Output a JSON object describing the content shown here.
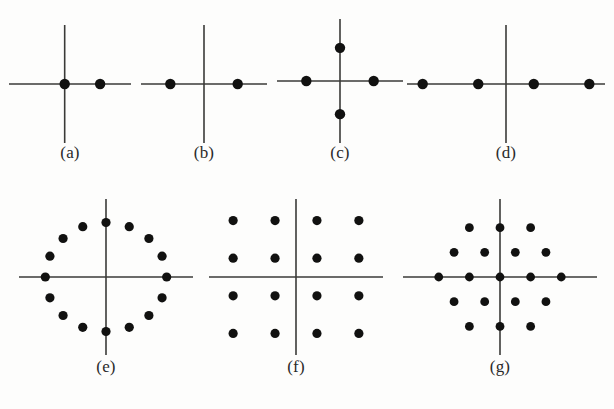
{
  "figure": {
    "background_color": "#fdfdfc",
    "axis_color": "#3a3a38",
    "dot_color": "#111110",
    "label_color": "#2a2a2a",
    "width": 614,
    "height": 409,
    "row_count": 2
  },
  "chart_data": {
    "type": "scatter",
    "subtitle": "",
    "xlabel": "",
    "ylabel": "",
    "grid": false,
    "legend": "none",
    "axis_style": "cross-through-origin",
    "panel_count": 7,
    "panels": [
      {
        "label": "(a)",
        "name": "panel-a",
        "point_count": 2,
        "xlim": [
          -1.6,
          1.9
        ],
        "ylim": [
          -1.6,
          1.6
        ],
        "points": [
          {
            "x": 0.0,
            "y": 0.0
          },
          {
            "x": 1.0,
            "y": 0.0
          }
        ]
      },
      {
        "label": "(b)",
        "name": "panel-b",
        "point_count": 2,
        "xlim": [
          -1.9,
          1.9
        ],
        "ylim": [
          -1.6,
          1.6
        ],
        "points": [
          {
            "x": -1.0,
            "y": 0.0
          },
          {
            "x": 1.0,
            "y": 0.0
          }
        ]
      },
      {
        "label": "(c)",
        "name": "panel-c",
        "point_count": 4,
        "xlim": [
          -1.9,
          1.9
        ],
        "ylim": [
          -1.9,
          1.9
        ],
        "points": [
          {
            "x": 0.0,
            "y": 1.0
          },
          {
            "x": -1.0,
            "y": 0.0
          },
          {
            "x": 1.0,
            "y": 0.0
          },
          {
            "x": 0.0,
            "y": -1.0
          }
        ]
      },
      {
        "label": "(d)",
        "name": "panel-d",
        "point_count": 4,
        "xlim": [
          -3.6,
          3.6
        ],
        "ylim": [
          -1.9,
          1.9
        ],
        "points": [
          {
            "x": -3.0,
            "y": 0.0
          },
          {
            "x": -1.0,
            "y": 0.0
          },
          {
            "x": 1.0,
            "y": 0.0
          },
          {
            "x": 3.0,
            "y": 0.0
          }
        ]
      },
      {
        "label": "(e)",
        "name": "panel-e",
        "point_count": 16,
        "xlim": [
          -1.45,
          1.45
        ],
        "ylim": [
          -1.45,
          1.45
        ],
        "ring_radius": 1.0,
        "angles_deg": [
          0,
          22.5,
          45,
          67.5,
          90,
          112.5,
          135,
          157.5,
          180,
          202.5,
          225,
          247.5,
          270,
          292.5,
          315,
          337.5
        ],
        "points": [
          {
            "x": 1.0,
            "y": 0.0
          },
          {
            "x": 0.924,
            "y": 0.383
          },
          {
            "x": 0.707,
            "y": 0.707
          },
          {
            "x": 0.383,
            "y": 0.924
          },
          {
            "x": 0.0,
            "y": 1.0
          },
          {
            "x": -0.383,
            "y": 0.924
          },
          {
            "x": -0.707,
            "y": 0.707
          },
          {
            "x": -0.924,
            "y": 0.383
          },
          {
            "x": -1.0,
            "y": 0.0
          },
          {
            "x": -0.924,
            "y": -0.383
          },
          {
            "x": -0.707,
            "y": -0.707
          },
          {
            "x": -0.383,
            "y": -0.924
          },
          {
            "x": 0.0,
            "y": -1.0
          },
          {
            "x": 0.383,
            "y": -0.924
          },
          {
            "x": 0.707,
            "y": -0.707
          },
          {
            "x": 0.924,
            "y": -0.383
          }
        ]
      },
      {
        "label": "(f)",
        "name": "panel-f",
        "point_count": 16,
        "xlim": [
          -4.2,
          4.2
        ],
        "ylim": [
          -4.2,
          4.2
        ],
        "points": [
          {
            "x": -3,
            "y": 3
          },
          {
            "x": -1,
            "y": 3
          },
          {
            "x": 1,
            "y": 3
          },
          {
            "x": 3,
            "y": 3
          },
          {
            "x": -3,
            "y": 1
          },
          {
            "x": -1,
            "y": 1
          },
          {
            "x": 1,
            "y": 1
          },
          {
            "x": 3,
            "y": 1
          },
          {
            "x": -3,
            "y": -1
          },
          {
            "x": -1,
            "y": -1
          },
          {
            "x": 1,
            "y": -1
          },
          {
            "x": 3,
            "y": -1
          },
          {
            "x": -3,
            "y": -3
          },
          {
            "x": -1,
            "y": -3
          },
          {
            "x": 1,
            "y": -3
          },
          {
            "x": 3,
            "y": -3
          }
        ]
      },
      {
        "label": "(g)",
        "name": "panel-g",
        "point_count": 19,
        "xlim": [
          -3.2,
          3.2
        ],
        "ylim": [
          -3.2,
          3.2
        ],
        "row_counts": [
          3,
          4,
          5,
          4,
          3
        ],
        "points": [
          {
            "x": -1,
            "y": 2
          },
          {
            "x": 0,
            "y": 2
          },
          {
            "x": 1,
            "y": 2
          },
          {
            "x": -1.5,
            "y": 1
          },
          {
            "x": -0.5,
            "y": 1
          },
          {
            "x": 0.5,
            "y": 1
          },
          {
            "x": 1.5,
            "y": 1
          },
          {
            "x": -2,
            "y": 0
          },
          {
            "x": -1,
            "y": 0
          },
          {
            "x": 0,
            "y": 0
          },
          {
            "x": 1,
            "y": 0
          },
          {
            "x": 2,
            "y": 0
          },
          {
            "x": -1.5,
            "y": -1
          },
          {
            "x": -0.5,
            "y": -1
          },
          {
            "x": 0.5,
            "y": -1
          },
          {
            "x": 1.5,
            "y": -1
          },
          {
            "x": -1,
            "y": -2
          },
          {
            "x": 0,
            "y": -2
          },
          {
            "x": 1,
            "y": -2
          }
        ]
      }
    ]
  },
  "labels": {
    "a": "(a)",
    "b": "(b)",
    "c": "(c)",
    "d": "(d)",
    "e": "(e)",
    "f": "(f)",
    "g": "(g)"
  }
}
